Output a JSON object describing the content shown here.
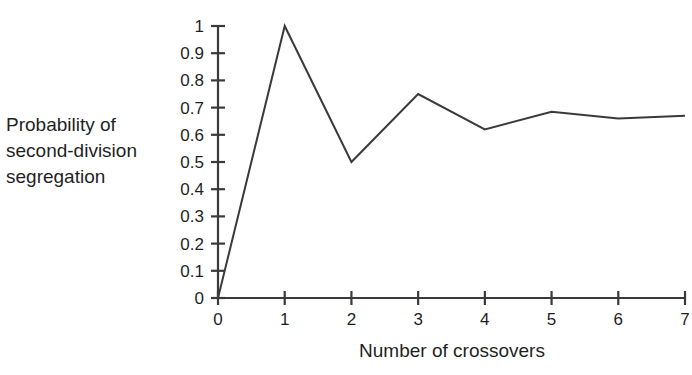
{
  "chart_data": {
    "type": "line",
    "title": "",
    "xlabel": "Number of crossovers",
    "ylabel": "Probability of\nsecond-division\nsegregation",
    "x": [
      0,
      1,
      2,
      3,
      4,
      5,
      6,
      7
    ],
    "values": [
      0,
      1,
      0.5,
      0.75,
      0.62,
      0.685,
      0.66,
      0.67
    ],
    "series": [
      {
        "name": "Probability of second-division segregation",
        "values": [
          0,
          1,
          0.5,
          0.75,
          0.62,
          0.685,
          0.66,
          0.67
        ]
      }
    ],
    "xlim": [
      0,
      7
    ],
    "ylim": [
      0,
      1
    ],
    "xticks": [
      0,
      1,
      2,
      3,
      4,
      5,
      6,
      7
    ],
    "xtick_labels": [
      "0",
      "1",
      "2",
      "3",
      "4",
      "5",
      "6",
      "7"
    ],
    "yticks": [
      0,
      0.1,
      0.2,
      0.3,
      0.4,
      0.5,
      0.6,
      0.7,
      0.8,
      0.9,
      1
    ],
    "ytick_labels": [
      "0",
      "0.1",
      "0.2",
      "0.3",
      "0.4",
      "0.5",
      "0.6",
      "0.7",
      "0.8",
      "0.9",
      "1"
    ],
    "grid": false,
    "legend": "none",
    "line_color": "#3a3a3a",
    "axis_color": "#3a3a3a",
    "background_color": "#ffffff",
    "text_color": "#1f1f1f"
  }
}
